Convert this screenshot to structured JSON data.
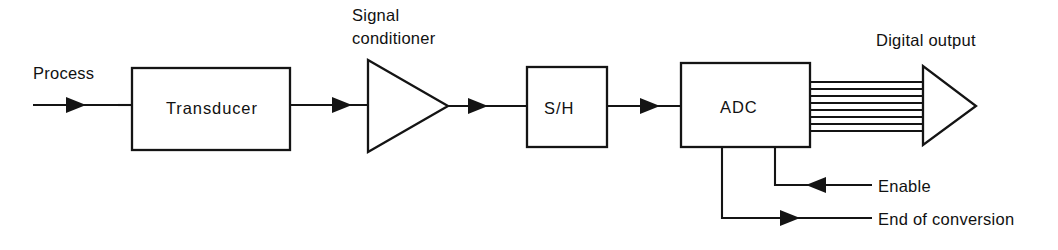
{
  "diagram": {
    "stroke_color": "#141414",
    "background_color": "#ffffff",
    "text_color": "#111111"
  },
  "blocks": {
    "transducer": {
      "label": "Transducer",
      "shape": "rectangle"
    },
    "signal_conditioner": {
      "label_line1": "Signal",
      "label_line2": "conditioner",
      "shape": "triangle-amplifier"
    },
    "sample_hold": {
      "label": "S/H",
      "shape": "rectangle"
    },
    "adc": {
      "label": "ADC",
      "shape": "rectangle"
    },
    "digital_output": {
      "label": "Digital output",
      "shape": "triangle-buffer",
      "bus_lines": 8
    }
  },
  "signals": {
    "process_input": {
      "label": "Process",
      "direction": "in"
    },
    "enable": {
      "label": "Enable",
      "direction": "in"
    },
    "end_of_conversion": {
      "label": "End of conversion",
      "direction": "out"
    }
  }
}
